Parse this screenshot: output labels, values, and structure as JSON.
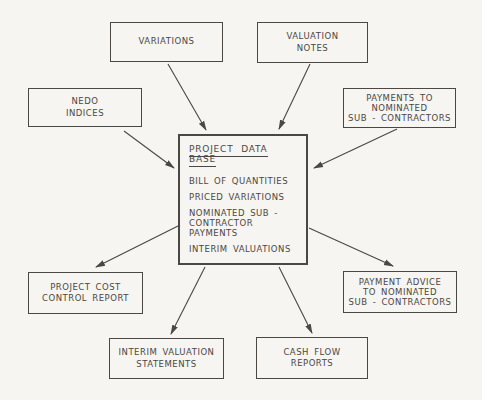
{
  "page": {
    "background": "#f6f5f2",
    "ink": "#4b4742"
  },
  "diagram": {
    "center": {
      "title": "PROJECT DATA BASE",
      "items": [
        [
          "BILL OF QUANTITIES"
        ],
        [
          "PRICED VARIATIONS"
        ],
        [
          "NOMINATED SUB -",
          "CONTRACTOR PAYMENTS"
        ],
        [
          "INTERIM VALUATIONS"
        ]
      ]
    },
    "nodes": {
      "variations": {
        "lines": [
          "VARIATIONS"
        ]
      },
      "valuation_notes": {
        "lines": [
          "VALUATION",
          "NOTES"
        ]
      },
      "nedo_indices": {
        "lines": [
          "NEDO",
          "INDICES"
        ]
      },
      "payments_to_subcontractors": {
        "lines": [
          "PAYMENTS TO",
          "NOMINATED",
          "SUB - CONTRACTORS"
        ]
      },
      "project_cost_control_report": {
        "lines": [
          "PROJECT COST",
          "CONTROL REPORT"
        ]
      },
      "payment_advice": {
        "lines": [
          "PAYMENT ADVICE",
          "TO NOMINATED",
          "SUB - CONTRACTORS"
        ]
      },
      "interim_valuation_statements": {
        "lines": [
          "INTERIM VALUATION",
          "STATEMENTS"
        ]
      },
      "cash_flow_reports": {
        "lines": [
          "CASH FLOW",
          "REPORTS"
        ]
      }
    },
    "connections": [
      {
        "from": "variations",
        "to": "project-data-base"
      },
      {
        "from": "valuation-notes",
        "to": "project-data-base"
      },
      {
        "from": "nedo-indices",
        "to": "project-data-base"
      },
      {
        "from": "payments-to-nominated-sub-contractors",
        "to": "project-data-base"
      },
      {
        "from": "project-data-base",
        "to": "project-cost-control-report"
      },
      {
        "from": "project-data-base",
        "to": "payment-advice-to-nominated-sub-contractors"
      },
      {
        "from": "project-data-base",
        "to": "interim-valuation-statements"
      },
      {
        "from": "project-data-base",
        "to": "cash-flow-reports"
      }
    ]
  }
}
